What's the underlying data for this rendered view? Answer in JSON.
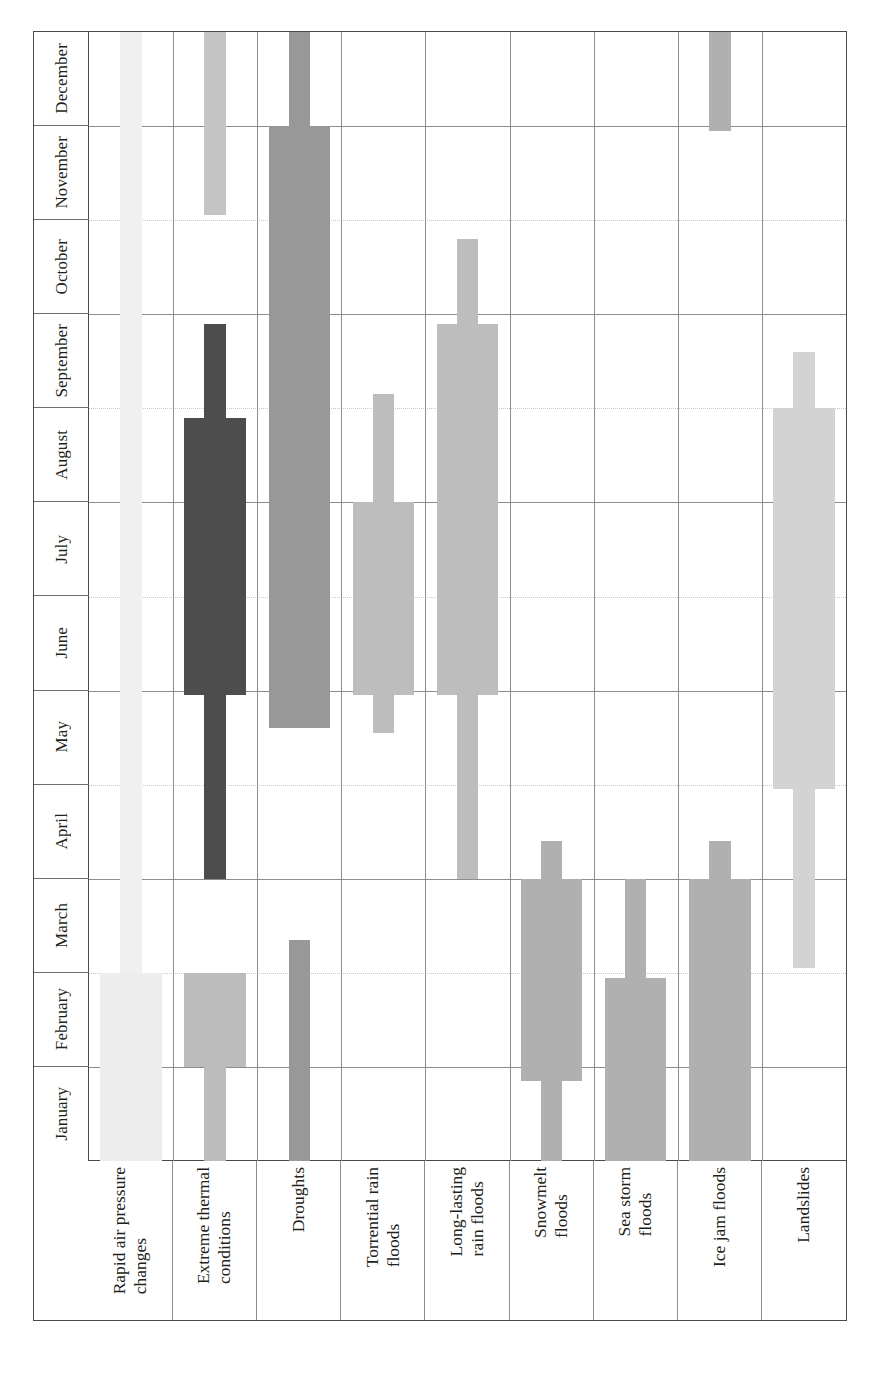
{
  "chart_data": {
    "type": "bar",
    "title": "",
    "subtitle": "",
    "xlabel": "",
    "ylabel": "",
    "orientation": "rotated-gantt",
    "grid": true,
    "legend": null,
    "axis_months": [
      "January",
      "February",
      "March",
      "April",
      "May",
      "June",
      "July",
      "August",
      "September",
      "October",
      "November",
      "December"
    ],
    "categories": [
      "Rapid air pressure changes",
      "Extreme thermal conditions",
      "Droughts",
      "Torrential rain floods",
      "Long-lasting rain floods",
      "Snowmelt floods",
      "Sea storm floods",
      "Ice jam floods",
      "Landslides"
    ],
    "note": "Each category shows a narrow band = extended occurrence period, and a wide band = peak occurrence period, measured in months (1=January .. 13=end of December).",
    "series": [
      {
        "name": "Rapid air pressure changes",
        "color": "#f0f0f0",
        "peak_color": "#ededed",
        "extent_start_month": 1.0,
        "extent_end_month": 13.0,
        "peak_start_month": 1.0,
        "peak_end_month": 3.0
      },
      {
        "name": "Extreme thermal conditions",
        "color": "#bcbcbc",
        "peak_color": "#c4c4c4",
        "extent_start_month": 1.0,
        "extent_end_month": 13.0,
        "peak_start_month": 1.0,
        "peak_end_month": 3.0,
        "segments": [
          {
            "kind": "narrow",
            "start_month": 11.05,
            "end_month": 13.0,
            "color": "#c4c4c4"
          },
          {
            "kind": "narrow",
            "start_month": 4.0,
            "end_month": 9.9,
            "color": "#4d4d4d"
          },
          {
            "kind": "wide",
            "start_month": 5.95,
            "end_month": 8.9,
            "color": "#4d4d4d"
          },
          {
            "kind": "narrow",
            "start_month": 1.0,
            "end_month": 3.0,
            "color": "#bcbcbc"
          },
          {
            "kind": "wide",
            "start_month": 2.0,
            "end_month": 3.0,
            "color": "#bcbcbc"
          }
        ]
      },
      {
        "name": "Droughts",
        "color": "#989898",
        "segments": [
          {
            "kind": "narrow",
            "start_month": 5.6,
            "end_month": 13.0,
            "color": "#989898"
          },
          {
            "kind": "wide",
            "start_month": 5.6,
            "end_month": 12.0,
            "color": "#989898"
          },
          {
            "kind": "narrow",
            "start_month": 1.0,
            "end_month": 3.35,
            "color": "#989898"
          }
        ]
      },
      {
        "name": "Torrential rain floods",
        "color": "#bdbdbd",
        "segments": [
          {
            "kind": "narrow",
            "start_month": 5.55,
            "end_month": 9.15,
            "color": "#bdbdbd"
          },
          {
            "kind": "wide",
            "start_month": 5.95,
            "end_month": 8.0,
            "color": "#bdbdbd"
          }
        ]
      },
      {
        "name": "Long-lasting rain floods",
        "color": "#bdbdbd",
        "segments": [
          {
            "kind": "narrow",
            "start_month": 4.0,
            "end_month": 10.8,
            "color": "#bdbdbd"
          },
          {
            "kind": "wide",
            "start_month": 5.95,
            "end_month": 9.9,
            "color": "#bdbdbd"
          }
        ]
      },
      {
        "name": "Snowmelt floods",
        "color": "#b0b0b0",
        "segments": [
          {
            "kind": "narrow",
            "start_month": 1.0,
            "end_month": 4.4,
            "color": "#b0b0b0"
          },
          {
            "kind": "wide",
            "start_month": 1.85,
            "end_month": 4.0,
            "color": "#b0b0b0"
          }
        ]
      },
      {
        "name": "Sea storm floods",
        "color": "#b0b0b0",
        "segments": [
          {
            "kind": "narrow",
            "start_month": 1.0,
            "end_month": 4.0,
            "color": "#b0b0b0"
          },
          {
            "kind": "wide",
            "start_month": 1.0,
            "end_month": 2.95,
            "color": "#b0b0b0"
          }
        ]
      },
      {
        "name": "Ice jam floods",
        "color": "#b0b0b0",
        "segments": [
          {
            "kind": "narrow",
            "start_month": 1.0,
            "end_month": 4.4,
            "color": "#b0b0b0"
          },
          {
            "kind": "wide",
            "start_month": 1.0,
            "end_month": 4.0,
            "color": "#b0b0b0"
          },
          {
            "kind": "narrow",
            "start_month": 11.95,
            "end_month": 13.0,
            "color": "#b0b0b0"
          }
        ]
      },
      {
        "name": "Landslides",
        "color": "#d3d3d3",
        "segments": [
          {
            "kind": "narrow",
            "start_month": 3.05,
            "end_month": 9.6,
            "color": "#d3d3d3"
          },
          {
            "kind": "wide",
            "start_month": 4.95,
            "end_month": 9.0,
            "color": "#d3d3d3"
          }
        ]
      }
    ]
  },
  "axis": {
    "months": [
      {
        "label": "December"
      },
      {
        "label": "November"
      },
      {
        "label": "October"
      },
      {
        "label": "September"
      },
      {
        "label": "August"
      },
      {
        "label": "July"
      },
      {
        "label": "June"
      },
      {
        "label": "May"
      },
      {
        "label": "April"
      },
      {
        "label": "March"
      },
      {
        "label": "February"
      },
      {
        "label": "January"
      }
    ],
    "categories": [
      {
        "label": "Rapid air pressure\nchanges"
      },
      {
        "label": "Extreme thermal\nconditions"
      },
      {
        "label": "Droughts"
      },
      {
        "label": "Torrential rain\nfloods"
      },
      {
        "label": "Long-lasting\nrain floods"
      },
      {
        "label": "Snowmelt\nfloods"
      },
      {
        "label": "Sea storm\nfloods"
      },
      {
        "label": "Ice jam floods"
      },
      {
        "label": "Landslides"
      }
    ]
  },
  "colors": {
    "frame": "#4a4a4a",
    "grid": "#8d8d8d",
    "grid_minor": "#c9c9c9",
    "text": "#231f20",
    "very_light": "#f0f0f0",
    "light": "#d3d3d3",
    "mid_light": "#bdbdbd",
    "mid": "#b0b0b0",
    "mid_dark": "#989898",
    "dark": "#4d4d4d"
  }
}
